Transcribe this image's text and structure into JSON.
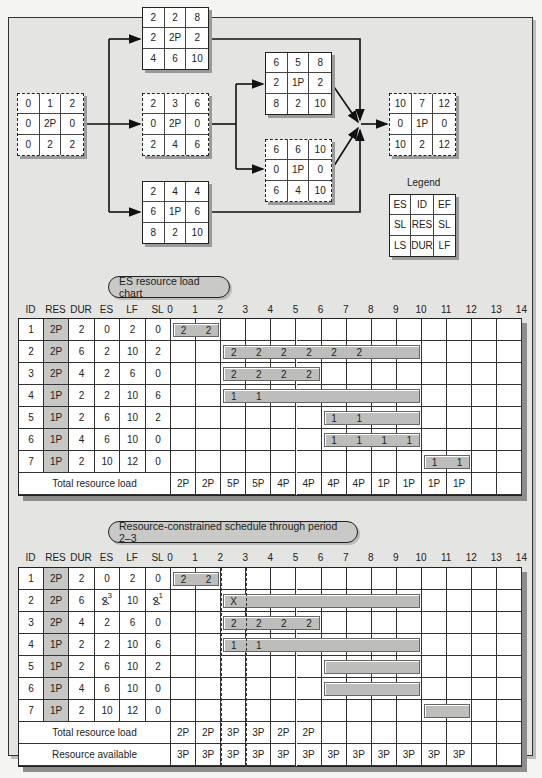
{
  "network": {
    "nodes": [
      {
        "id": "A",
        "style": "dashed",
        "x": 17,
        "y": 93,
        "cells": [
          "0",
          "1",
          "2",
          "0",
          "2P",
          "0",
          "0",
          "2",
          "2"
        ]
      },
      {
        "id": "B",
        "style": "solid",
        "x": 142,
        "y": 7,
        "cells": [
          "2",
          "2",
          "8",
          "2",
          "2P",
          "2",
          "4",
          "6",
          "10"
        ]
      },
      {
        "id": "C",
        "style": "dashed",
        "x": 142,
        "y": 93,
        "cells": [
          "2",
          "3",
          "6",
          "0",
          "2P",
          "0",
          "2",
          "4",
          "6"
        ]
      },
      {
        "id": "D",
        "style": "solid",
        "x": 142,
        "y": 181,
        "cells": [
          "2",
          "4",
          "4",
          "6",
          "1P",
          "6",
          "8",
          "2",
          "10"
        ]
      },
      {
        "id": "E",
        "style": "solid",
        "x": 265,
        "y": 52,
        "cells": [
          "6",
          "5",
          "8",
          "2",
          "1P",
          "2",
          "8",
          "2",
          "10"
        ]
      },
      {
        "id": "F",
        "style": "dashed",
        "x": 265,
        "y": 139,
        "cells": [
          "6",
          "6",
          "10",
          "0",
          "1P",
          "0",
          "6",
          "4",
          "10"
        ]
      },
      {
        "id": "G",
        "style": "dashed",
        "x": 389,
        "y": 93,
        "cells": [
          "10",
          "7",
          "12",
          "0",
          "1P",
          "0",
          "10",
          "2",
          "12"
        ]
      }
    ],
    "legend": {
      "title": "Legend",
      "cells": [
        "ES",
        "ID",
        "EF",
        "SL",
        "RES",
        "SL",
        "LS",
        "DUR",
        "LF"
      ]
    }
  },
  "chart1": {
    "title": "ES resource load chart",
    "headers": [
      "ID",
      "RES",
      "DUR",
      "ES",
      "LF",
      "SL"
    ],
    "periods": [
      "0",
      "1",
      "2",
      "3",
      "4",
      "5",
      "6",
      "7",
      "8",
      "9",
      "10",
      "11",
      "12",
      "13",
      "14"
    ],
    "rows": [
      {
        "id": "1",
        "res": "2P",
        "dur": "2",
        "es": "0",
        "lf": "2",
        "sl": "0",
        "bar": [
          0,
          2
        ],
        "labels": [
          "2",
          "2"
        ]
      },
      {
        "id": "2",
        "res": "2P",
        "dur": "6",
        "es": "2",
        "lf": "10",
        "sl": "2",
        "bar": [
          2,
          10
        ],
        "labels": [
          "2",
          "2",
          "2",
          "2",
          "2",
          "2"
        ]
      },
      {
        "id": "3",
        "res": "2P",
        "dur": "4",
        "es": "2",
        "lf": "6",
        "sl": "0",
        "bar": [
          2,
          6
        ],
        "labels": [
          "2",
          "2",
          "2",
          "2"
        ]
      },
      {
        "id": "4",
        "res": "1P",
        "dur": "2",
        "es": "2",
        "lf": "10",
        "sl": "6",
        "bar": [
          2,
          10
        ],
        "labels": [
          "1",
          "1"
        ]
      },
      {
        "id": "5",
        "res": "1P",
        "dur": "2",
        "es": "6",
        "lf": "10",
        "sl": "2",
        "bar": [
          6,
          10
        ],
        "labels": [
          "1",
          "1"
        ]
      },
      {
        "id": "6",
        "res": "1P",
        "dur": "4",
        "es": "6",
        "lf": "10",
        "sl": "0",
        "bar": [
          6,
          10
        ],
        "labels": [
          "1",
          "1",
          "1",
          "1"
        ]
      },
      {
        "id": "7",
        "res": "1P",
        "dur": "2",
        "es": "10",
        "lf": "12",
        "sl": "0",
        "bar": [
          10,
          12
        ],
        "labels": [
          "1",
          "1"
        ]
      }
    ],
    "total_label": "Total resource load",
    "totals": [
      "2P",
      "2P",
      "5P",
      "5P",
      "4P",
      "4P",
      "4P",
      "4P",
      "1P",
      "1P",
      "1P",
      "1P",
      "",
      ""
    ]
  },
  "chart2": {
    "title": "Resource-constrained schedule through period 2–3",
    "headers": [
      "ID",
      "RES",
      "DUR",
      "ES",
      "LF",
      "SL"
    ],
    "periods": [
      "0",
      "1",
      "2",
      "3",
      "4",
      "5",
      "6",
      "7",
      "8",
      "9",
      "10",
      "11",
      "12",
      "13",
      "14"
    ],
    "rows": [
      {
        "id": "1",
        "res": "2P",
        "dur": "2",
        "es": "0",
        "lf": "2",
        "sl": "0",
        "bar": [
          0,
          2
        ],
        "labels": [
          "2",
          "2"
        ]
      },
      {
        "id": "2",
        "res": "2P",
        "dur": "6",
        "es": "2",
        "es_new": "3",
        "lf": "10",
        "sl": "2",
        "sl_new": "1",
        "bar": [
          2,
          10
        ],
        "labels": [
          "X"
        ]
      },
      {
        "id": "3",
        "res": "2P",
        "dur": "4",
        "es": "2",
        "lf": "6",
        "sl": "0",
        "bar": [
          2,
          6
        ],
        "labels": [
          "2",
          "2",
          "2",
          "2"
        ]
      },
      {
        "id": "4",
        "res": "1P",
        "dur": "2",
        "es": "2",
        "lf": "10",
        "sl": "6",
        "bar": [
          2,
          10
        ],
        "labels": [
          "1",
          "1"
        ]
      },
      {
        "id": "5",
        "res": "1P",
        "dur": "2",
        "es": "6",
        "lf": "10",
        "sl": "2",
        "bar": [
          6,
          10
        ],
        "labels": []
      },
      {
        "id": "6",
        "res": "1P",
        "dur": "4",
        "es": "6",
        "lf": "10",
        "sl": "0",
        "bar": [
          6,
          10
        ],
        "labels": []
      },
      {
        "id": "7",
        "res": "1P",
        "dur": "2",
        "es": "10",
        "lf": "12",
        "sl": "0",
        "bar": [
          10,
          12
        ],
        "labels": []
      }
    ],
    "total_label": "Total resource load",
    "totals": [
      "2P",
      "2P",
      "3P",
      "3P",
      "2P",
      "2P",
      "",
      "",
      "",
      "",
      "",
      "",
      "",
      ""
    ],
    "avail_label": "Resource available",
    "available": [
      "3P",
      "3P",
      "3P",
      "3P",
      "3P",
      "3P",
      "3P",
      "3P",
      "3P",
      "3P",
      "3P",
      "3P",
      "",
      ""
    ]
  }
}
